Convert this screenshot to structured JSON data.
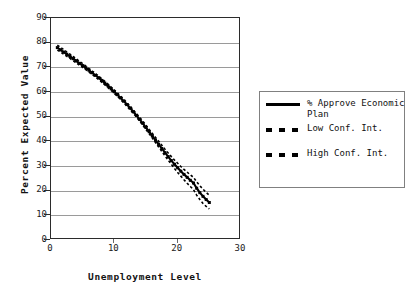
{
  "chart_data": {
    "type": "line",
    "title": "",
    "xlabel": "Unemployment Level",
    "ylabel": "Percent Expected Value",
    "xlim": [
      0,
      30
    ],
    "ylim": [
      0,
      90
    ],
    "xticks": [
      0,
      10,
      20,
      30
    ],
    "yticks": [
      0,
      10,
      20,
      30,
      40,
      50,
      60,
      70,
      80,
      90
    ],
    "grid": "horizontal",
    "legend_position": "right",
    "x": [
      1,
      1.5,
      2,
      2.5,
      3,
      3.5,
      4,
      4.5,
      5,
      5.5,
      6,
      6.5,
      7,
      7.5,
      8,
      8.5,
      9,
      9.5,
      10,
      10.5,
      11,
      11.5,
      12,
      12.5,
      13,
      13.5,
      14,
      14.5,
      15,
      15.5,
      16,
      16.5,
      17,
      17.5,
      18,
      18.5,
      19,
      19.5,
      20,
      20.5,
      21,
      21.5,
      22,
      22.5,
      23,
      23.5,
      24,
      24.5,
      25
    ],
    "series": [
      {
        "name": "% Approve Economic Plan",
        "style": "solid",
        "color": "#000000",
        "values": [
          78.0,
          77.1,
          76.2,
          75.3,
          74.4,
          73.5,
          72.6,
          71.6,
          70.7,
          69.8,
          68.8,
          67.8,
          66.8,
          65.8,
          64.7,
          63.6,
          62.5,
          61.3,
          60.1,
          58.9,
          57.6,
          56.3,
          54.9,
          53.5,
          52.0,
          50.5,
          48.9,
          47.3,
          45.6,
          43.9,
          42.2,
          40.5,
          38.8,
          37.1,
          35.4,
          33.8,
          32.2,
          30.7,
          29.3,
          27.9,
          26.6,
          25.4,
          24.2,
          23.1,
          21.0,
          19.2,
          17.7,
          16.4,
          15.2
        ]
      },
      {
        "name": "Low Conf. Int.",
        "style": "dashed",
        "color": "#000000",
        "values": [
          77.0,
          76.2,
          75.3,
          74.5,
          73.6,
          72.7,
          71.8,
          70.9,
          70.0,
          69.1,
          68.1,
          67.1,
          66.1,
          65.1,
          64.0,
          62.9,
          61.8,
          60.6,
          59.4,
          58.2,
          56.9,
          55.6,
          54.2,
          52.8,
          51.3,
          49.8,
          48.2,
          46.5,
          44.8,
          43.1,
          41.3,
          39.5,
          37.7,
          35.9,
          34.1,
          32.4,
          30.7,
          29.0,
          27.4,
          25.9,
          24.4,
          23.0,
          21.7,
          20.4,
          18.2,
          16.4,
          14.8,
          13.6,
          12.6
        ]
      },
      {
        "name": "High Conf. Int.",
        "style": "dashed",
        "color": "#000000",
        "values": [
          79.0,
          78.1,
          77.2,
          76.2,
          75.3,
          74.4,
          73.4,
          72.4,
          71.5,
          70.5,
          69.5,
          68.5,
          67.5,
          66.5,
          65.4,
          64.3,
          63.2,
          62.0,
          60.8,
          59.6,
          58.3,
          57.0,
          55.6,
          54.2,
          52.7,
          51.2,
          49.7,
          48.1,
          46.5,
          44.8,
          43.2,
          41.6,
          40.0,
          38.4,
          36.8,
          35.3,
          33.8,
          32.4,
          31.1,
          29.8,
          28.6,
          27.5,
          26.4,
          25.4,
          23.6,
          22.0,
          20.6,
          19.3,
          18.1
        ]
      }
    ]
  },
  "legend": {
    "entries": [
      {
        "label": "% Approve Economic Plan",
        "style": "solid"
      },
      {
        "label": "Low Conf. Int.",
        "style": "dashed"
      },
      {
        "label": "High Conf. Int.",
        "style": "dashed"
      }
    ]
  },
  "colors": {
    "series": "#000000",
    "grid": "#9a9a9a",
    "frame": "#2b2b2b",
    "legend_border": "#808080",
    "background": "#ffffff"
  }
}
